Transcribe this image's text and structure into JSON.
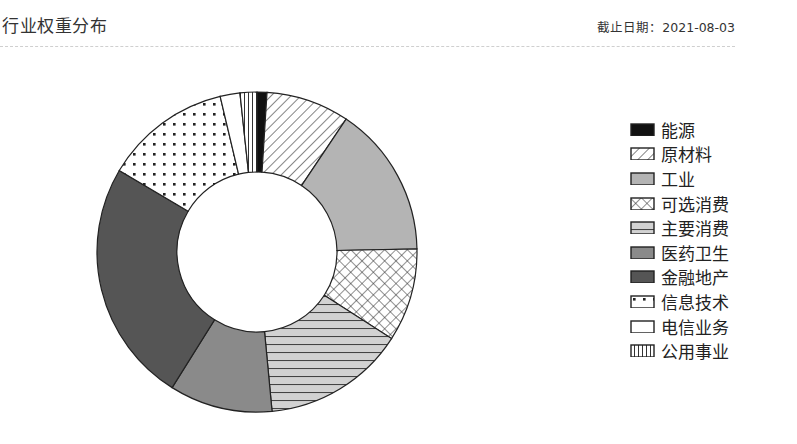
{
  "header": {
    "title": "行业权重分布",
    "date_label": "截止日期：2021-08-03"
  },
  "chart_data": {
    "type": "pie",
    "variant": "donut",
    "title": "行业权重分布",
    "as_of": "2021-08-03",
    "unit": "%",
    "start_angle_deg": 0,
    "direction": "clockwise",
    "legend_position": "right",
    "categories": [
      "能源",
      "原材料",
      "工业",
      "可选消费",
      "主要消费",
      "医药卫生",
      "金融地产",
      "信息技术",
      "电信业务",
      "公用事业"
    ],
    "values": [
      1.0,
      8.4,
      15.3,
      9.4,
      14.4,
      10.4,
      24.6,
      12.8,
      2.0,
      1.7
    ],
    "patterns": [
      "solid-black",
      "diagonal-hatch",
      "light-gray",
      "crosshatch",
      "horizontal-lines",
      "medium-gray",
      "dark-gray",
      "dots",
      "white",
      "vertical-lines"
    ]
  },
  "legend": {
    "items": [
      {
        "label": "能源"
      },
      {
        "label": "原材料"
      },
      {
        "label": "工业"
      },
      {
        "label": "可选消费"
      },
      {
        "label": "主要消费"
      },
      {
        "label": "医药卫生"
      },
      {
        "label": "金融地产"
      },
      {
        "label": "信息技术"
      },
      {
        "label": "电信业务"
      },
      {
        "label": "公用事业"
      }
    ]
  },
  "colors": {
    "stroke": "#222222",
    "light_gray": "#b4b4b4",
    "medium_gray": "#8a8a8a",
    "dark_gray": "#555555",
    "black": "#111111"
  }
}
